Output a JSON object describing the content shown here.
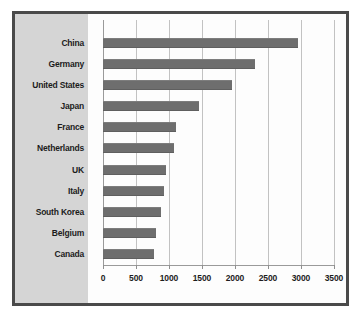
{
  "chart_data": {
    "type": "bar",
    "orientation": "horizontal",
    "title": "",
    "xlabel": "",
    "ylabel": "",
    "xlim": [
      0,
      3500
    ],
    "xticks": [
      0,
      500,
      1000,
      1500,
      2000,
      2500,
      3000,
      3500
    ],
    "xtick_labels": [
      "0",
      "500",
      "1000",
      "1500",
      "2000",
      "2500",
      "3000",
      "3500"
    ],
    "grid": true,
    "legend": false,
    "categories": [
      "China",
      "Germany",
      "United States",
      "Japan",
      "France",
      "Netherlands",
      "UK",
      "Italy",
      "South Korea",
      "Belgium",
      "Canada"
    ],
    "values": [
      2950,
      2300,
      1950,
      1450,
      1110,
      1070,
      960,
      930,
      880,
      800,
      780
    ],
    "series": [
      {
        "name": "Value",
        "values": [
          2950,
          2300,
          1950,
          1450,
          1110,
          1070,
          960,
          930,
          880,
          800,
          780
        ]
      }
    ]
  },
  "style": {
    "bar_color": "#6e6e6e",
    "panel_color": "#d5d5d5",
    "plot_background": "#fdfdfd",
    "frame_color": "#4a4a4a",
    "grid_color": "#c2c2c2",
    "axis_color": "#9a9a9a",
    "text_color": "#1c1c1c"
  }
}
